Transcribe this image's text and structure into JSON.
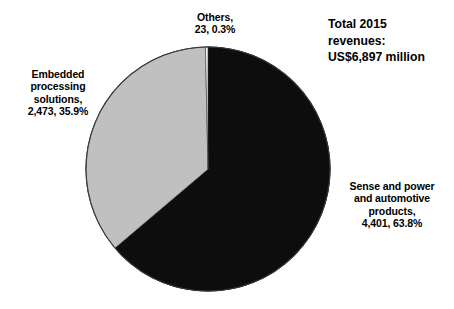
{
  "chart_data": {
    "type": "pie",
    "title": "Total 2015 revenues: US$6,897 million",
    "title_lines": "Total 2015\nrevenues:\nUS$6,897 million",
    "total_label": "US$6,897 million",
    "total_value": 6897,
    "units": "US$ million",
    "year": "2015",
    "categories": [
      "Sense and power and automotive products",
      "Embedded processing solutions",
      "Others"
    ],
    "values": [
      4401,
      2473,
      23
    ],
    "percentages": [
      63.8,
      35.9,
      0.3
    ],
    "colors": [
      "#0d0d0d",
      "#c0c0c0",
      "#ffffff"
    ],
    "start_angle_deg": 0,
    "direction": "clockwise",
    "legend": "none",
    "grid": false,
    "xlabel": "",
    "ylabel": "",
    "slices": [
      {
        "name": "Sense and power and automotive products",
        "value": 4401,
        "percent": 63.8,
        "color": "#0d0d0d",
        "label_lines": "Sense and power\nand automotive\nproducts,\n4,401, 63.8%"
      },
      {
        "name": "Embedded processing solutions",
        "value": 2473,
        "percent": 35.9,
        "color": "#c0c0c0",
        "label_lines": "Embedded\nprocessing\nsolutions,\n2,473, 35.9%"
      },
      {
        "name": "Others",
        "value": 23,
        "percent": 0.3,
        "color": "#ffffff",
        "label_lines": "Others,\n23, 0.3%"
      }
    ]
  },
  "labels": {
    "others": "Others,\n23, 0.3%",
    "embedded": "Embedded\nprocessing\nsolutions,\n2,473, 35.9%",
    "sense": "Sense and power\nand automotive\nproducts,\n4,401, 63.8%",
    "title": "Total 2015\nrevenues:\nUS$6,897 million"
  },
  "geometry": {
    "center_x": 208,
    "center_y": 169,
    "radius": 122
  },
  "colors": {
    "background": "#ffffff",
    "slice_dark": "#0d0d0d",
    "slice_gray": "#c0c0c0",
    "slice_white": "#ffffff",
    "outline": "#2b2b2b",
    "text": "#000000"
  }
}
